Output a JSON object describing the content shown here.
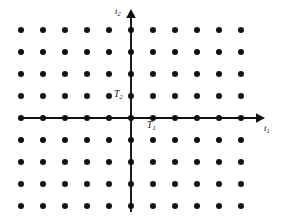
{
  "figure": {
    "background_color": "#ffffff",
    "ink_color": "#111111",
    "width": 285,
    "height": 219
  },
  "axes": {
    "horizontal": {
      "name": "horizontal-axis",
      "label": "t",
      "subscript": "1",
      "label_text": "t1",
      "arrow": "right",
      "x_start": 22,
      "x_end": 262,
      "y": 118
    },
    "vertical": {
      "name": "vertical-axis",
      "label": "t",
      "subscript": "2",
      "label_text": "t2",
      "arrow": "up",
      "y_start": 12,
      "y_end": 212,
      "x": 131
    }
  },
  "annotations": [
    {
      "id": "T1",
      "label": "T",
      "subscript": "1",
      "label_text": "T1",
      "meaning": "horizontal-sampling-period",
      "x": 147,
      "y": 121
    },
    {
      "id": "T2",
      "label": "T",
      "subscript": "2",
      "label_text": "T2",
      "meaning": "vertical-sampling-period",
      "x": 114,
      "y": 90
    }
  ],
  "chart_data": {
    "type": "scatter",
    "title": "",
    "xlabel": "t1",
    "ylabel": "t2",
    "grid": false,
    "legend": null,
    "marker": {
      "shape": "circle",
      "color": "#111111",
      "size_px": 6
    },
    "lattice": {
      "origin_px": [
        131,
        118
      ],
      "spacing_px": [
        22,
        22
      ],
      "columns": 11,
      "rows": 9,
      "n1_range": [
        -5,
        5
      ],
      "n2_range": [
        -4,
        4
      ]
    },
    "x": [
      -5,
      -4,
      -3,
      -2,
      -1,
      0,
      1,
      2,
      3,
      4,
      5
    ],
    "y": [
      -4,
      -3,
      -2,
      -1,
      0,
      1,
      2,
      3,
      4
    ],
    "points_description": "all integer pairs (n1*T1, n2*T2) for n1 in -5..5 and n2 in -4..4",
    "annotations": [
      "T1",
      "T2"
    ],
    "xlim": [
      -5.5,
      5.5
    ],
    "ylim": [
      -4.5,
      4.5
    ]
  }
}
